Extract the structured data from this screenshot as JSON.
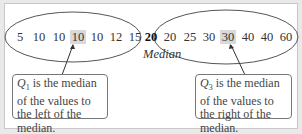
{
  "diagram": {
    "left_values": [
      "5",
      "10",
      "10",
      "10",
      "10",
      "12",
      "15"
    ],
    "left_highlight_index": 3,
    "median_value": "20",
    "median_label": "Median",
    "right_values": [
      "20",
      "25",
      "30",
      "30",
      "40",
      "40",
      "60"
    ],
    "right_highlight_index": 3,
    "q1_callout": {
      "symbol": "Q",
      "subscript": "1",
      "text": " is the median of the values to the left of the median."
    },
    "q3_callout": {
      "symbol": "Q",
      "subscript": "3",
      "text": " is the median of the values to the right of the median."
    },
    "colors": {
      "highlight": "#d9d9d9",
      "ellipse_stroke": "#555555",
      "panel_border": "#c9c9c9",
      "background": "#e9e9e9"
    }
  }
}
